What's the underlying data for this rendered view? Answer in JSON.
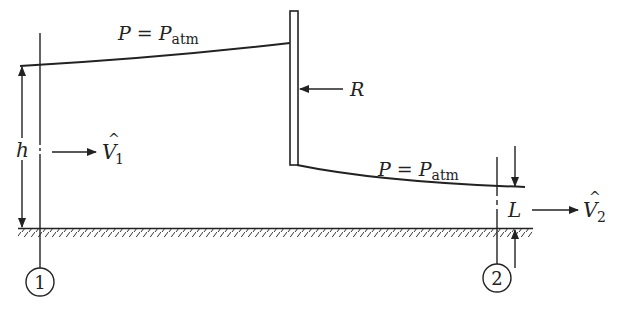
{
  "diagram": {
    "upstream_surface_label": {
      "P": "P",
      "eq": " = ",
      "Pbase": "P",
      "sub": "atm"
    },
    "downstream_surface_label": {
      "P": "P",
      "eq": " = ",
      "Pbase": "P",
      "sub": "atm"
    },
    "gate_force_label": "R",
    "upstream_depth_label": "h",
    "downstream_depth_label": "L",
    "upstream_velocity_label": {
      "base": "V",
      "hat": "^",
      "sub": "1"
    },
    "downstream_velocity_label": {
      "base": "V",
      "hat": "^",
      "sub": "2"
    },
    "section_1_label": "1",
    "section_2_label": "2",
    "colors": {
      "stroke": "#222222",
      "background": "#ffffff"
    }
  }
}
